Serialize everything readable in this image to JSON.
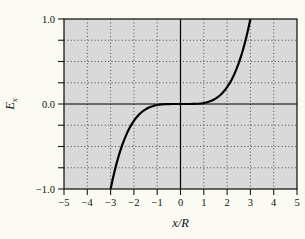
{
  "figure": {
    "background": "#fbfbf4",
    "plot_background": "#d9d9d9",
    "border_color": "#1a1a1a",
    "grid_color": "#4a4a4a",
    "axis_line_color": "#000000",
    "curve_color": "#000000",
    "text_color": "#111111"
  },
  "chart_data": {
    "type": "line",
    "title": "",
    "xlabel": "x/R",
    "ylabel": "E_x",
    "ylabel_base": "E",
    "ylabel_sub": "x",
    "xlim": [
      -5,
      5
    ],
    "ylim": [
      -1.0,
      1.0
    ],
    "grid": "dotted",
    "legend": "none",
    "xticks": [
      {
        "value": -5,
        "label": "−5"
      },
      {
        "value": -4,
        "label": "−4"
      },
      {
        "value": -3,
        "label": "−3"
      },
      {
        "value": -2,
        "label": "−2"
      },
      {
        "value": -1,
        "label": "−1"
      },
      {
        "value": 0,
        "label": "0"
      },
      {
        "value": 1,
        "label": "1"
      },
      {
        "value": 2,
        "label": "2"
      },
      {
        "value": 3,
        "label": "3"
      },
      {
        "value": 4,
        "label": "4"
      },
      {
        "value": 5,
        "label": "5"
      }
    ],
    "ytick_values": [
      -1.0,
      -0.75,
      -0.5,
      -0.25,
      0.0,
      0.25,
      0.5,
      0.75,
      1.0
    ],
    "ytick_labels": [
      {
        "value": 1.0,
        "label": "1.0"
      },
      {
        "value": 0.0,
        "label": "0.0"
      },
      {
        "value": -1.0,
        "label": "−1.0"
      }
    ],
    "grid_x": [
      -4,
      -3,
      -2,
      -1,
      1,
      2,
      3,
      4
    ],
    "grid_y": [
      -0.75,
      -0.5,
      -0.25,
      0.25,
      0.5,
      0.75
    ],
    "zero_axes": true,
    "series": [
      {
        "name": "Ex_vs_xR",
        "points": [
          [
            -3.0,
            -1.0
          ],
          [
            -2.95,
            -0.935
          ],
          [
            -2.9,
            -0.873
          ],
          [
            -2.85,
            -0.815
          ],
          [
            -2.8,
            -0.759
          ],
          [
            -2.75,
            -0.706
          ],
          [
            -2.7,
            -0.656
          ],
          [
            -2.65,
            -0.609
          ],
          [
            -2.6,
            -0.564
          ],
          [
            -2.55,
            -0.522
          ],
          [
            -2.5,
            -0.482
          ],
          [
            -2.4,
            -0.41
          ],
          [
            -2.3,
            -0.345
          ],
          [
            -2.2,
            -0.289
          ],
          [
            -2.1,
            -0.24
          ],
          [
            -2.0,
            -0.198
          ],
          [
            -1.9,
            -0.161
          ],
          [
            -1.8,
            -0.13
          ],
          [
            -1.7,
            -0.103
          ],
          [
            -1.6,
            -0.081
          ],
          [
            -1.5,
            -0.063
          ],
          [
            -1.4,
            -0.047
          ],
          [
            -1.3,
            -0.035
          ],
          [
            -1.2,
            -0.026
          ],
          [
            -1.1,
            -0.018
          ],
          [
            -1.0,
            -0.012
          ],
          [
            -0.9,
            -0.008
          ],
          [
            -0.8,
            -0.005
          ],
          [
            -0.7,
            -0.003
          ],
          [
            -0.6,
            -0.002
          ],
          [
            -0.5,
            -0.001
          ],
          [
            -0.4,
            0.0
          ],
          [
            -0.3,
            0.0
          ],
          [
            -0.2,
            0.0
          ],
          [
            -0.1,
            0.0
          ],
          [
            0.0,
            0.0
          ],
          [
            0.1,
            0.0
          ],
          [
            0.2,
            0.0
          ],
          [
            0.3,
            0.0
          ],
          [
            0.4,
            0.0
          ],
          [
            0.5,
            0.001
          ],
          [
            0.6,
            0.002
          ],
          [
            0.7,
            0.003
          ],
          [
            0.8,
            0.005
          ],
          [
            0.9,
            0.008
          ],
          [
            1.0,
            0.012
          ],
          [
            1.1,
            0.018
          ],
          [
            1.2,
            0.026
          ],
          [
            1.3,
            0.035
          ],
          [
            1.4,
            0.047
          ],
          [
            1.5,
            0.063
          ],
          [
            1.6,
            0.081
          ],
          [
            1.7,
            0.103
          ],
          [
            1.8,
            0.13
          ],
          [
            1.9,
            0.161
          ],
          [
            2.0,
            0.198
          ],
          [
            2.1,
            0.24
          ],
          [
            2.2,
            0.289
          ],
          [
            2.3,
            0.345
          ],
          [
            2.4,
            0.41
          ],
          [
            2.5,
            0.482
          ],
          [
            2.55,
            0.522
          ],
          [
            2.6,
            0.564
          ],
          [
            2.65,
            0.609
          ],
          [
            2.7,
            0.656
          ],
          [
            2.75,
            0.706
          ],
          [
            2.8,
            0.759
          ],
          [
            2.85,
            0.815
          ],
          [
            2.9,
            0.873
          ],
          [
            2.95,
            0.935
          ],
          [
            3.0,
            1.0
          ]
        ]
      }
    ]
  }
}
